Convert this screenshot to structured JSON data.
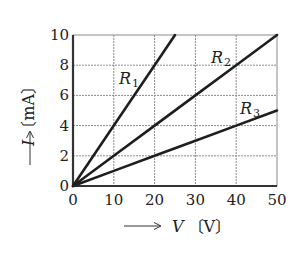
{
  "chart_data": {
    "type": "line",
    "title": "",
    "xlabel": "V〔V〕",
    "ylabel": "I〔mA〕",
    "x_axis": {
      "label_var": "V",
      "label_unit": "〔V〕",
      "range": [
        0,
        50
      ],
      "ticks": [
        0,
        10,
        20,
        30,
        40,
        50
      ]
    },
    "y_axis": {
      "label_var": "I",
      "label_unit": "〔mA〕",
      "range": [
        0,
        10
      ],
      "ticks": [
        0,
        2,
        4,
        6,
        8,
        10
      ]
    },
    "grid": true,
    "legend": "inline labels",
    "series": [
      {
        "name": "R1",
        "label_main": "R",
        "label_sub": "1",
        "x": [
          0,
          10,
          20,
          25
        ],
        "y": [
          0,
          4,
          8,
          10
        ],
        "slope_mA_per_V": 0.4
      },
      {
        "name": "R2",
        "label_main": "R",
        "label_sub": "2",
        "x": [
          0,
          10,
          20,
          30,
          40,
          50
        ],
        "y": [
          0,
          2,
          4,
          6,
          8,
          10
        ],
        "slope_mA_per_V": 0.2
      },
      {
        "name": "R3",
        "label_main": "R",
        "label_sub": "3",
        "x": [
          0,
          10,
          20,
          30,
          40,
          50
        ],
        "y": [
          0,
          1,
          2,
          3,
          4,
          5
        ],
        "slope_mA_per_V": 0.1
      }
    ]
  },
  "colors": {
    "line": "#1e1e1e",
    "grid": "#8a8a8a",
    "axis": "#333333"
  }
}
